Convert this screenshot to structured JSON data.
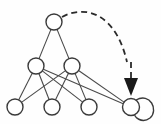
{
  "figure": {
    "background_color": "#fefefe",
    "node_fill": "#ffffff",
    "node_stroke": "#3a3a3a",
    "edge_color": "#4a4a4a",
    "arrow_color": "#1a1a1a",
    "dashed_color": "#2b2b2b"
  },
  "graph": {
    "node_radius": 8,
    "nodes": [
      {
        "id": "root",
        "label": "",
        "cx": 54,
        "cy": 22,
        "r": 8,
        "layer": "top"
      },
      {
        "id": "mid-l",
        "label": "",
        "cx": 36,
        "cy": 66,
        "r": 8,
        "layer": "middle"
      },
      {
        "id": "mid-r",
        "label": "",
        "cx": 72,
        "cy": 66,
        "r": 8,
        "layer": "middle"
      },
      {
        "id": "leaf-1",
        "label": "",
        "cx": 15,
        "cy": 107,
        "r": 8,
        "layer": "bottom"
      },
      {
        "id": "leaf-2",
        "label": "",
        "cx": 52,
        "cy": 107,
        "r": 8,
        "layer": "bottom"
      },
      {
        "id": "leaf-3",
        "label": "",
        "cx": 89,
        "cy": 107,
        "r": 8,
        "layer": "bottom"
      },
      {
        "id": "sink",
        "label": "",
        "cx": 131,
        "cy": 107,
        "r": 8.5,
        "layer": "bottom"
      }
    ],
    "edges": [
      {
        "id": "e1",
        "from": "root",
        "to": "mid-l",
        "style": "solid"
      },
      {
        "id": "e2",
        "from": "root",
        "to": "mid-r",
        "style": "solid"
      },
      {
        "id": "e3",
        "from": "mid-l",
        "to": "leaf-1",
        "style": "solid"
      },
      {
        "id": "e4",
        "from": "mid-l",
        "to": "leaf-2",
        "style": "solid"
      },
      {
        "id": "e5",
        "from": "mid-l",
        "to": "leaf-3",
        "style": "solid"
      },
      {
        "id": "e6",
        "from": "mid-l",
        "to": "sink",
        "style": "solid"
      },
      {
        "id": "e7",
        "from": "mid-r",
        "to": "leaf-1",
        "style": "solid"
      },
      {
        "id": "e8",
        "from": "mid-r",
        "to": "leaf-2",
        "style": "solid"
      },
      {
        "id": "e9",
        "from": "mid-r",
        "to": "leaf-3",
        "style": "solid"
      },
      {
        "id": "e10",
        "from": "mid-r",
        "to": "sink",
        "style": "solid"
      }
    ],
    "dashed_arrow": {
      "id": "feedback-arrow",
      "from": "root",
      "to": "sink",
      "style": "dashed",
      "path": "M 62 17 C 86 4, 116 14, 127 62",
      "dash_pattern": "6 4",
      "arrowhead_points": "124,78 138,78 131,96"
    },
    "self_loop": {
      "id": "sink-self-loop",
      "on": "sink",
      "path": "M 136 100 C 150 92, 159 110, 150 118 C 142 124, 133 117, 135 113"
    }
  }
}
